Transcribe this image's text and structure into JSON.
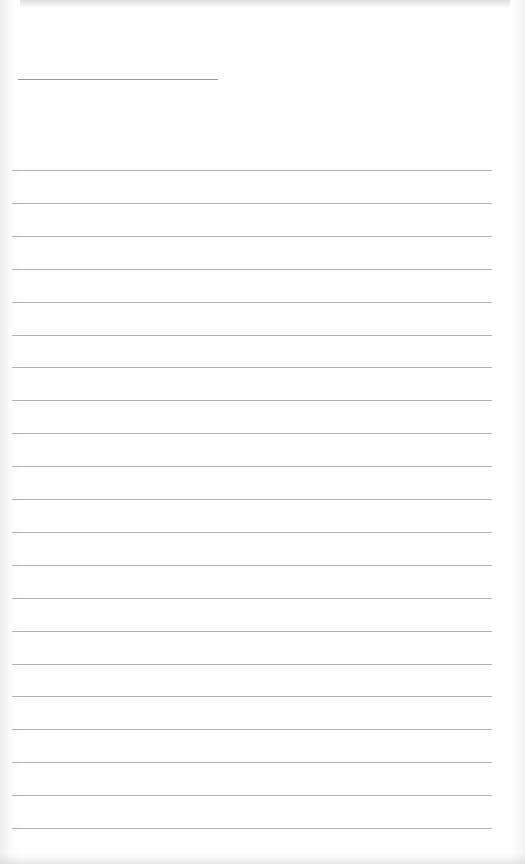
{
  "page": {
    "type": "lined-paper",
    "title_line": {
      "present": true
    },
    "rule_count": 21,
    "rule_color": "#b3b3b3",
    "background": "#ffffff"
  }
}
